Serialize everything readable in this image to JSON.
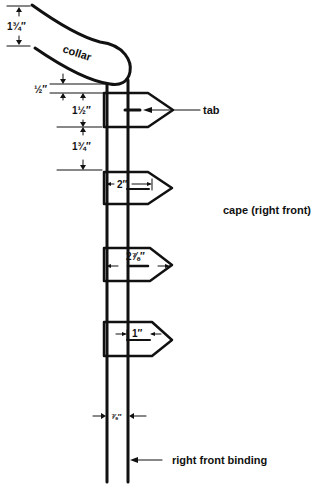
{
  "diagram": {
    "labels": {
      "collar": "collar",
      "tab": "tab",
      "cape": "cape (right front)",
      "binding": "right front binding"
    },
    "dimensions": {
      "collar_width": "1¾″",
      "gap_above_tab": "½″",
      "tab_height": "1½″",
      "tab_spacing": "1¾″",
      "binding_width": "⅞″"
    },
    "tabs": [
      {
        "id": "tab-1",
        "length_label": ""
      },
      {
        "id": "tab-2",
        "length_label": "2″"
      },
      {
        "id": "tab-3",
        "length_label": "2⅞″"
      },
      {
        "id": "tab-4",
        "length_label": "1″"
      }
    ]
  }
}
